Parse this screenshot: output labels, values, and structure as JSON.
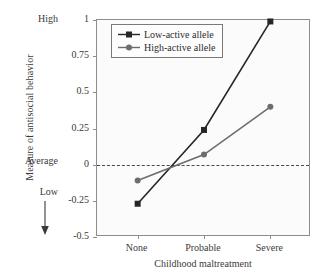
{
  "chart_data": {
    "type": "line",
    "title": "",
    "xlabel": "Childhood maltreatment",
    "ylabel": "Measure of antisocial behavior",
    "categories": [
      "None",
      "Probable",
      "Severe"
    ],
    "series": [
      {
        "name": "Low-active allele",
        "values": [
          -0.27,
          0.24,
          0.99
        ],
        "color": "#262626",
        "marker": "square"
      },
      {
        "name": "High-active allele",
        "values": [
          -0.11,
          0.07,
          0.4
        ],
        "color": "#6d6d6d",
        "marker": "circle"
      }
    ],
    "ylim": [
      -0.5,
      1
    ],
    "yticks": [
      "1",
      "0.75",
      "0.5",
      "0.25",
      "0",
      "-0.25",
      "-0.5"
    ],
    "ytick_values": [
      1,
      0.75,
      0.5,
      0.25,
      0,
      -0.25,
      -0.5
    ],
    "y_qualitative": {
      "high": "High",
      "average": "Average",
      "low": "Low"
    },
    "reference_line": {
      "value": 0,
      "style": "dashed"
    },
    "grid": false,
    "legend_position": "top-left",
    "axis_arrow": "down-arrow-icon"
  },
  "legend": {
    "entries": [
      {
        "label": "Low-active allele"
      },
      {
        "label": "High-active allele"
      }
    ]
  },
  "axes": {
    "y_title": "Measure of antisocial behavior",
    "x_title": "Childhood maltreatment"
  }
}
